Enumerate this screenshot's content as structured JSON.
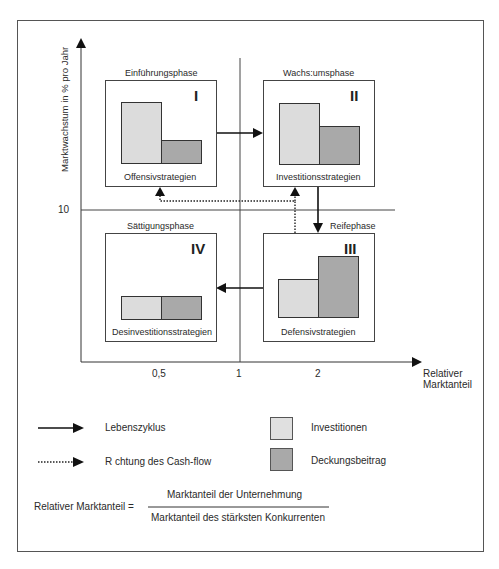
{
  "diagram": {
    "axes": {
      "y_title": "Marktwachstum in % pro Jahr",
      "y_tick": "10",
      "x_title_line1": "Relativer",
      "x_title_line2": "Marktanteil",
      "x_ticks": [
        "0,5",
        "1",
        "2"
      ]
    },
    "phases": [
      {
        "id": "I",
        "name": "Einführungsphase",
        "strategy": "Offensivstrategien",
        "investitionen": 75,
        "deckungsbeitrag": 25
      },
      {
        "id": "II",
        "name": "Wachs:umsphase",
        "strategy": "Investitionsstrategien",
        "investitionen": 75,
        "deckungsbeitrag": 47
      },
      {
        "id": "III",
        "name": "Reifephase",
        "strategy": "Defensivstrategien",
        "investitionen": 47,
        "deckungsbeitrag": 75
      },
      {
        "id": "IV",
        "name": "Sättigungsphase",
        "strategy": "Desinvestitionsstrategien",
        "investitionen": 28,
        "deckungsbeitrag": 28
      }
    ],
    "legend": {
      "solid_arrow": "Lebenszyklus",
      "dotted_arrow": "R chtung des Cash-flow",
      "light_box": "Investitionen",
      "dark_box": "Deckungsbeitrag"
    },
    "formula": {
      "lhs": "Relativer Marktanteil =",
      "numerator": "Marktanteil der Unternehmung",
      "denominator": "Marktanteil des stärksten Konkurrenten"
    },
    "colors": {
      "investitionen": "#dcdcdc",
      "deckungsbeitrag": "#a9a9a9",
      "lines": "#222222"
    }
  }
}
